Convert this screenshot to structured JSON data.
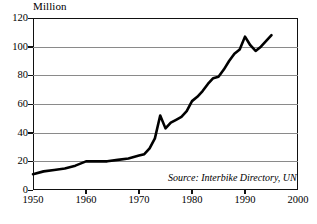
{
  "chart_data": {
    "type": "line",
    "title": "",
    "subtitle": "",
    "unit_label": "Million",
    "xlabel": "",
    "ylabel": "Million",
    "xlim": [
      1950,
      2000
    ],
    "ylim": [
      0,
      120
    ],
    "grid": true,
    "legend": false,
    "annotation": "Source: Interbike Directory, UN",
    "xticks": [
      1950,
      1960,
      1970,
      1980,
      1990,
      2000
    ],
    "xtick_labels": [
      "1950",
      "1960",
      "1970",
      "1980",
      "1990",
      "2000"
    ],
    "yticks": [
      0,
      20,
      40,
      60,
      80,
      100,
      120
    ],
    "ytick_labels": [
      "0",
      "20",
      "40",
      "60",
      "80",
      "100",
      "120"
    ],
    "series": [
      {
        "name": "World Bicycle Production",
        "color": "#000000",
        "x": [
          1950,
          1952,
          1954,
          1956,
          1958,
          1960,
          1962,
          1964,
          1966,
          1968,
          1970,
          1971,
          1972,
          1973,
          1974,
          1975,
          1976,
          1977,
          1978,
          1979,
          1980,
          1981,
          1982,
          1983,
          1984,
          1985,
          1986,
          1987,
          1988,
          1989,
          1990,
          1991,
          1992,
          1993,
          1994,
          1995
        ],
        "values": [
          11,
          13,
          14,
          15,
          17,
          20,
          20,
          20,
          21,
          22,
          24,
          25,
          29,
          36,
          52,
          43,
          47,
          49,
          51,
          55,
          62,
          65,
          69,
          74,
          78,
          79,
          84,
          90,
          95,
          98,
          107,
          101,
          97,
          100,
          104,
          108
        ]
      }
    ]
  },
  "axes": {
    "unit_label": "Million",
    "source_note": "Source: Interbike Directory, UN"
  }
}
